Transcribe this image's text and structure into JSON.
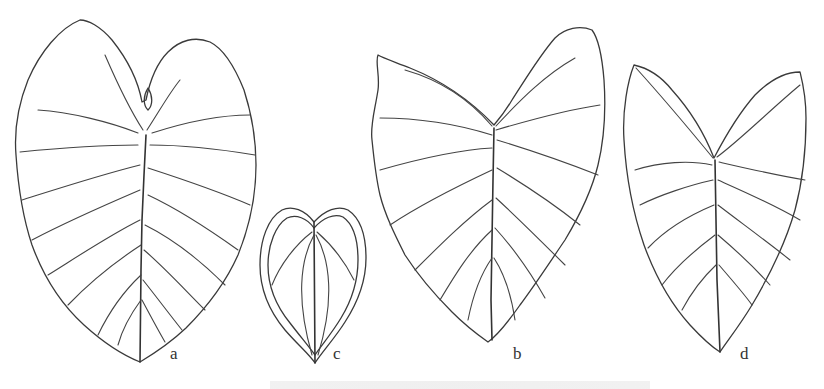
{
  "figure": {
    "type": "botanical line drawing",
    "colors": {
      "background": "#ffffff",
      "ink": "#3a3a3a"
    },
    "leaves": [
      {
        "id": "a",
        "label": "a",
        "shape": "broad cordate-ovate, wavy margin, many lateral veins"
      },
      {
        "id": "c",
        "label": "c",
        "shape": "small cordate, intramarginal collective vein"
      },
      {
        "id": "b",
        "label": "b",
        "shape": "sagittate-cordate, wide sinus, wavy margin"
      },
      {
        "id": "d",
        "label": "d",
        "shape": "cordate-sagittate, acuminate tip"
      }
    ],
    "caption": ""
  }
}
